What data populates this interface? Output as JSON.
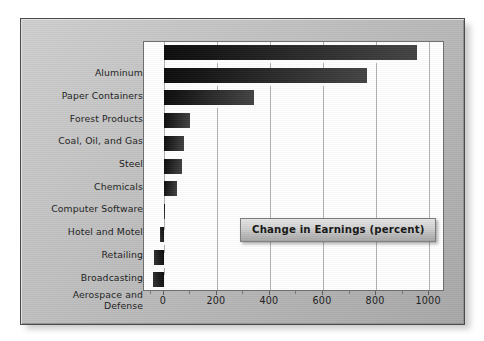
{
  "chart_data": {
    "type": "bar",
    "orientation": "horizontal",
    "title": "Change in Earnings (percent)",
    "xlabel": "",
    "ylabel": "",
    "xlim": [
      -75,
      1060
    ],
    "xticks": [
      0,
      200,
      400,
      600,
      800,
      1000
    ],
    "xtick_labels": [
      "0",
      "200",
      "400",
      "600",
      "800",
      "1000"
    ],
    "grid": true,
    "grid_axis": "x",
    "legend": false,
    "bar_color": "#1a1a1a",
    "categories": [
      "Aluminum",
      "Paper Containers",
      "Forest Products",
      "Coal, Oil, and Gas",
      "Steel",
      "Chemicals",
      "Computer Software",
      "Hotel and Motel",
      "Retailing",
      "Broadcasting",
      "Aerospace and\nDefense"
    ],
    "values": [
      955,
      767,
      340,
      100,
      75,
      68,
      50,
      4,
      -15,
      -37,
      -40
    ],
    "series": [
      {
        "name": "Change in Earnings (percent)",
        "values": [
          955,
          767,
          340,
          100,
          75,
          68,
          50,
          4,
          -15,
          -37,
          -40
        ]
      }
    ]
  },
  "panel": {
    "background_color": "#c2c2c2",
    "border_color": "#4b4b4b"
  }
}
